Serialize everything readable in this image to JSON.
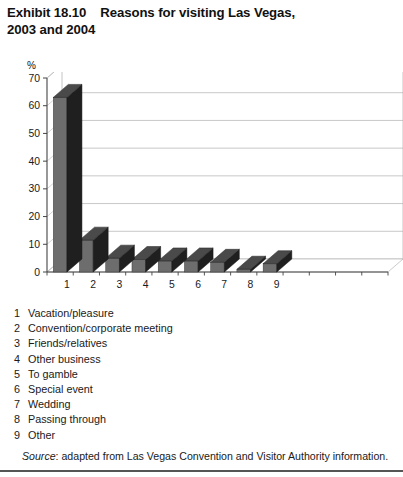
{
  "exhibit": {
    "label": "Exhibit 18.10",
    "title_line1": "Reasons for visiting Las Vegas,",
    "title_line2": "2003 and 2004"
  },
  "axis": {
    "unit_label": "%",
    "y_ticks": [
      "0",
      "10",
      "20",
      "30",
      "40",
      "50",
      "60",
      "70"
    ],
    "x_ticks": [
      "1",
      "2",
      "3",
      "4",
      "5",
      "6",
      "7",
      "8",
      "9"
    ]
  },
  "legend": {
    "items": [
      {
        "num": "1",
        "label": "Vacation/pleasure"
      },
      {
        "num": "2",
        "label": "Convention/corporate meeting"
      },
      {
        "num": "3",
        "label": "Friends/relatives"
      },
      {
        "num": "4",
        "label": "Other business"
      },
      {
        "num": "5",
        "label": "To gamble"
      },
      {
        "num": "6",
        "label": "Special event"
      },
      {
        "num": "7",
        "label": "Wedding"
      },
      {
        "num": "8",
        "label": "Passing through"
      },
      {
        "num": "9",
        "label": "Other"
      }
    ]
  },
  "source": {
    "word": "Source",
    "text": ": adapted from Las Vegas Convention and Visitor Authority information."
  },
  "colors": {
    "bar_front": "#6d6d6d",
    "bar_side": "#1f1f1f",
    "bar_top": "#4a4a4a",
    "axis": "#444444",
    "grid": "#b5b5b5",
    "text": "#1a1a1a",
    "rule": "#555555"
  },
  "chart_data": {
    "type": "bar",
    "xlabel": "",
    "ylabel": "%",
    "ylim": [
      0,
      70
    ],
    "ytick_step": 10,
    "grid": true,
    "legend_position": "below-chart-as-numbered-key",
    "style": "3d-column",
    "categories": [
      "1",
      "2",
      "3",
      "4",
      "5",
      "6",
      "7",
      "8",
      "9"
    ],
    "category_labels": [
      "Vacation/pleasure",
      "Convention/corporate meeting",
      "Friends/relatives",
      "Other business",
      "To gamble",
      "Special event",
      "Wedding",
      "Passing through",
      "Other"
    ],
    "values": [
      63,
      11.5,
      5,
      4.5,
      4,
      4,
      3.5,
      1,
      3
    ],
    "annotations": [],
    "note": "Values read from gridlines; single visible series (3D columns)."
  }
}
